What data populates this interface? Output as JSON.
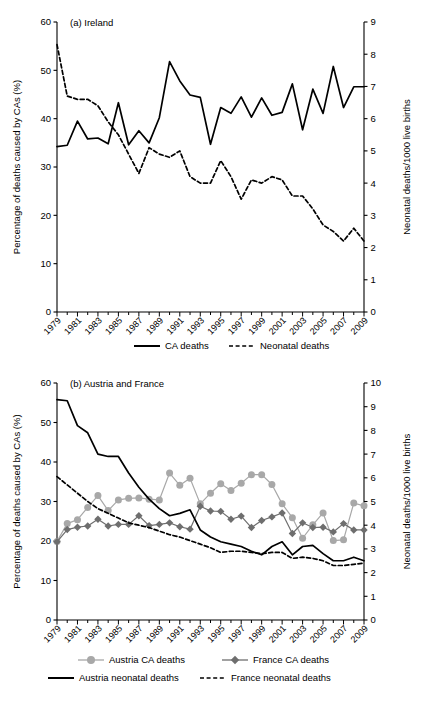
{
  "figure": {
    "width": 430,
    "height": 702,
    "background": "#ffffff"
  },
  "colors": {
    "line_dark": "#000000",
    "austria_marker": "#a8a8a8",
    "france_marker": "#6e6e6e",
    "axis": "#000000"
  },
  "chart_data": [
    {
      "type": "line",
      "title": "(a) Ireland",
      "xlabel": "",
      "ylabel": "Percentage of deaths caused by CAs (%)",
      "y2label": "Neonatal deaths/1000 live births",
      "xlim": [
        1979,
        2009
      ],
      "ylim": [
        0,
        60
      ],
      "y2lim": [
        0,
        9
      ],
      "yticks": [
        0,
        10,
        20,
        30,
        40,
        50,
        60
      ],
      "y2ticks": [
        0,
        1,
        2,
        3,
        4,
        5,
        6,
        7,
        8,
        9
      ],
      "xticks": [
        1979,
        1981,
        1983,
        1985,
        1987,
        1989,
        1991,
        1993,
        1995,
        1997,
        1999,
        2001,
        2003,
        2005,
        2007,
        2009
      ],
      "xtick_labels": [
        "1979",
        "1981",
        "1983",
        "1985",
        "1987",
        "1989",
        "1991",
        "1993",
        "1995",
        "1997",
        "1999",
        "2001",
        "2003",
        "2005",
        "2007",
        "2009"
      ],
      "grid": false,
      "legend_position": "below",
      "x": [
        1979,
        1980,
        1981,
        1982,
        1983,
        1984,
        1985,
        1986,
        1987,
        1988,
        1989,
        1990,
        1991,
        1992,
        1993,
        1994,
        1995,
        1996,
        1997,
        1998,
        1999,
        2000,
        2001,
        2002,
        2003,
        2004,
        2005,
        2006,
        2007,
        2008,
        2009
      ],
      "series": [
        {
          "name": "CA deaths",
          "axis": "left",
          "style": "solid",
          "color": "#000000",
          "values": [
            34.2,
            34.5,
            39.5,
            35.8,
            36.0,
            34.8,
            43.3,
            34.6,
            37.5,
            35.0,
            40.2,
            51.8,
            47.8,
            44.9,
            44.4,
            34.7,
            42.3,
            41.1,
            44.5,
            40.3,
            44.3,
            40.7,
            41.3,
            47.2,
            37.7,
            46.1,
            41.1,
            50.8,
            42.3,
            46.6,
            46.6
          ]
        },
        {
          "name": "Neonatal deaths",
          "axis": "right",
          "style": "dashed",
          "color": "#000000",
          "values": [
            8.3,
            6.7,
            6.6,
            6.6,
            6.4,
            5.9,
            5.5,
            4.9,
            4.3,
            5.1,
            4.9,
            4.8,
            5.0,
            4.2,
            4.0,
            4.0,
            4.7,
            4.2,
            3.5,
            4.1,
            4.0,
            4.2,
            4.1,
            3.6,
            3.6,
            3.2,
            2.7,
            2.5,
            2.2,
            2.6,
            2.2
          ]
        }
      ]
    },
    {
      "type": "line",
      "title": "(b) Austria and France",
      "xlabel": "",
      "ylabel": "Percentage of deaths caused by CAs (%)",
      "y2label": "Neonatal deaths/1000 live births",
      "xlim": [
        1979,
        2009
      ],
      "ylim": [
        0,
        60
      ],
      "y2lim": [
        0,
        10
      ],
      "yticks": [
        0,
        10,
        20,
        30,
        40,
        50,
        60
      ],
      "y2ticks": [
        0,
        1,
        2,
        3,
        4,
        5,
        6,
        7,
        8,
        9,
        10
      ],
      "xticks": [
        1979,
        1981,
        1983,
        1985,
        1987,
        1989,
        1991,
        1993,
        1995,
        1997,
        1999,
        2001,
        2003,
        2005,
        2007,
        2009
      ],
      "xtick_labels": [
        "1979",
        "1981",
        "1983",
        "1985",
        "1987",
        "1989",
        "1991",
        "1993",
        "1995",
        "1997",
        "1999",
        "2001",
        "2003",
        "2005",
        "2007",
        "2009"
      ],
      "grid": false,
      "legend_position": "below",
      "x": [
        1979,
        1980,
        1981,
        1982,
        1983,
        1984,
        1985,
        1986,
        1987,
        1988,
        1989,
        1990,
        1991,
        1992,
        1993,
        1994,
        1995,
        1996,
        1997,
        1998,
        1999,
        2000,
        2001,
        2002,
        2003,
        2004,
        2005,
        2006,
        2007,
        2008,
        2009
      ],
      "series": [
        {
          "name": "Austria CA deaths",
          "axis": "left",
          "style": "solid-marker",
          "marker": "circle",
          "color": "#a8a8a8",
          "values": [
            19.9,
            24.4,
            25.4,
            28.5,
            31.5,
            27.7,
            30.4,
            30.8,
            30.9,
            30.6,
            30.4,
            37.2,
            34.1,
            35.9,
            29.4,
            32.1,
            34.5,
            32.8,
            34.6,
            36.8,
            36.8,
            34.3,
            29.4,
            25.9,
            20.7,
            24.1,
            27.1,
            20.1,
            20.3,
            29.6,
            28.9
          ]
        },
        {
          "name": "France CA deaths",
          "axis": "left",
          "style": "solid-marker",
          "marker": "diamond",
          "color": "#6e6e6e",
          "values": [
            19.8,
            22.9,
            23.5,
            23.8,
            25.5,
            23.8,
            24.2,
            24.2,
            26.4,
            23.9,
            24.2,
            24.6,
            23.6,
            23.0,
            28.8,
            27.6,
            27.5,
            25.5,
            26.3,
            23.4,
            25.2,
            26.1,
            27.1,
            21.9,
            24.6,
            23.4,
            23.5,
            22.3,
            24.4,
            22.8,
            22.8
          ]
        },
        {
          "name": "Austria neonatal deaths",
          "axis": "right",
          "style": "solid",
          "color": "#000000",
          "values": [
            9.3,
            9.25,
            8.2,
            7.9,
            7.0,
            6.9,
            6.9,
            6.2,
            5.6,
            5.1,
            4.7,
            4.4,
            4.5,
            4.65,
            3.8,
            3.5,
            3.3,
            3.2,
            3.1,
            2.9,
            2.75,
            3.1,
            3.3,
            2.75,
            3.1,
            3.15,
            2.8,
            2.5,
            2.5,
            2.65,
            2.5
          ]
        },
        {
          "name": "France neonatal deaths",
          "axis": "right",
          "style": "dashed",
          "color": "#000000",
          "values": [
            6.05,
            5.7,
            5.35,
            5.0,
            4.7,
            4.5,
            4.3,
            4.1,
            4.0,
            3.9,
            3.75,
            3.6,
            3.5,
            3.35,
            3.2,
            3.05,
            2.85,
            2.9,
            2.9,
            2.85,
            2.8,
            2.85,
            2.85,
            2.6,
            2.65,
            2.6,
            2.5,
            2.3,
            2.3,
            2.35,
            2.4
          ]
        }
      ]
    }
  ],
  "panel_a": {
    "title": "(a) Ireland",
    "ylabel": "Percentage of deaths caused by CAs (%)",
    "y2label": "Neonatal deaths/1000 live births",
    "legend": [
      {
        "label": "CA deaths",
        "marker": "solid-line"
      },
      {
        "label": "Neonatal deaths",
        "marker": "dashed-line"
      }
    ]
  },
  "panel_b": {
    "title": "(b) Austria and France",
    "ylabel": "Percentage of deaths caused by CAs (%)",
    "y2label": "Neonatal deaths/1000 live births",
    "legend": [
      {
        "label": "Austria CA deaths",
        "marker": "circle-line"
      },
      {
        "label": "France CA deaths",
        "marker": "diamond-line"
      },
      {
        "label": "Austria neonatal deaths",
        "marker": "solid-line"
      },
      {
        "label": "France neonatal deaths",
        "marker": "dashed-line"
      }
    ]
  }
}
